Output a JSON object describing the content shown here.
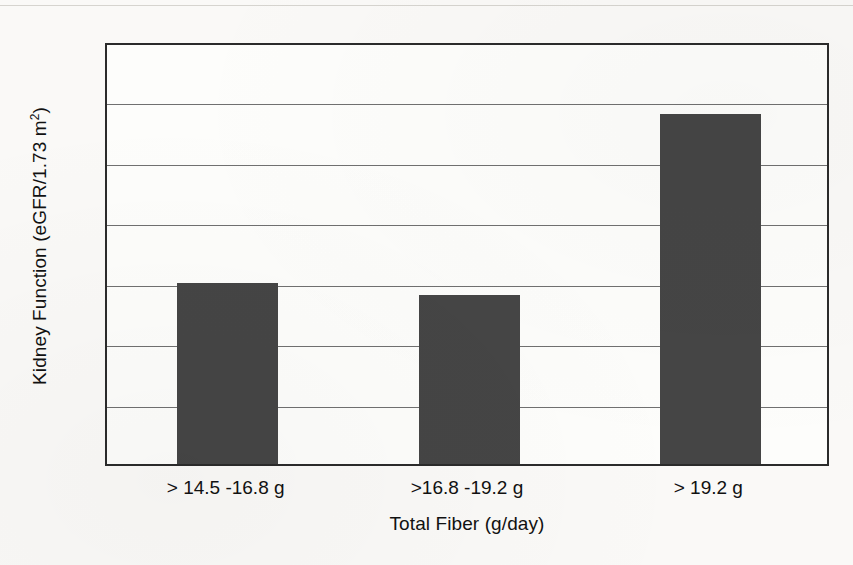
{
  "chart_data": {
    "type": "bar",
    "title": "",
    "categories": [
      "> 14.5 -16.8 g",
      ">16.8 -19.2 g",
      "> 19.2 g"
    ],
    "values": [
      1.5,
      1.4,
      2.9
    ],
    "xlabel": "Total Fiber (g/day)",
    "ylabel": "Kidney Function (eGFR/1.73 m",
    "ylabel_sup": "2",
    "ylabel_tail": ")",
    "ylim": [
      0,
      3.5
    ],
    "yticks": [
      "0",
      "0.5",
      "1",
      "1.5",
      "2",
      "2.5",
      "3",
      "3.5"
    ],
    "ytick_values": [
      0,
      0.5,
      1,
      1.5,
      2,
      2.5,
      3,
      3.5
    ],
    "grid": true,
    "grid_axis": "y",
    "legend": false,
    "legend_position": "none",
    "bar_color": "#454545",
    "grid_color": "#707070",
    "frame_color": "#2b2b2b",
    "background_color": "#faf9f7"
  }
}
